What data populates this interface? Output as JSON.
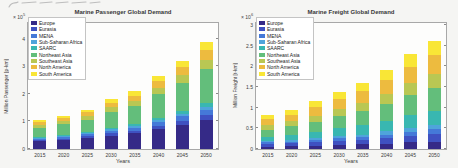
{
  "figure": {
    "background": "#f5f5f3",
    "plot_background": "#fdfdfc",
    "axis_color": "#a8a8a8"
  },
  "chart_data": [
    {
      "type": "stacked-bar",
      "title": "Marine Passenger Global Demand",
      "xlabel": "Years",
      "ylabel": "Million Passenger [p-km]",
      "scale_base": "× 10",
      "scale_exp": "5",
      "ylim": [
        0,
        4.57
      ],
      "yticks": [
        0,
        1,
        2,
        3,
        4
      ],
      "legend_position": "upper-left",
      "grid": false,
      "categories": [
        "2015",
        "2020",
        "2025",
        "2030",
        "2035",
        "2040",
        "2045",
        "2050"
      ],
      "series": [
        {
          "name": "Europe",
          "color": "#352a87",
          "values": [
            0.28,
            0.32,
            0.39,
            0.49,
            0.57,
            0.72,
            0.86,
            1.04
          ]
        },
        {
          "name": "Eurasia",
          "color": "#3f51c1",
          "values": [
            0.05,
            0.06,
            0.07,
            0.09,
            0.1,
            0.13,
            0.16,
            0.19
          ]
        },
        {
          "name": "MENA",
          "color": "#4579d8",
          "values": [
            0.05,
            0.06,
            0.07,
            0.09,
            0.1,
            0.13,
            0.16,
            0.19
          ]
        },
        {
          "name": "Sub-Saharan Africa",
          "color": "#4fa4db",
          "values": [
            0.03,
            0.04,
            0.04,
            0.05,
            0.06,
            0.08,
            0.1,
            0.12
          ]
        },
        {
          "name": "SAARC",
          "color": "#39b7b1",
          "values": [
            0.03,
            0.04,
            0.04,
            0.05,
            0.06,
            0.08,
            0.1,
            0.12
          ]
        },
        {
          "name": "Northeast Asia",
          "color": "#63be7b",
          "values": [
            0.34,
            0.38,
            0.46,
            0.58,
            0.67,
            0.85,
            1.02,
            1.23
          ]
        },
        {
          "name": "Southeast Asia",
          "color": "#b9c753",
          "values": [
            0.09,
            0.11,
            0.13,
            0.16,
            0.19,
            0.24,
            0.29,
            0.35
          ]
        },
        {
          "name": "North America",
          "color": "#edbb3f",
          "values": [
            0.1,
            0.11,
            0.13,
            0.16,
            0.19,
            0.24,
            0.29,
            0.35
          ]
        },
        {
          "name": "South America",
          "color": "#f9e636",
          "values": [
            0.07,
            0.08,
            0.1,
            0.13,
            0.15,
            0.19,
            0.23,
            0.28
          ]
        }
      ]
    },
    {
      "type": "stacked-bar",
      "title": "Marine Freight Global Demand",
      "xlabel": "Years",
      "ylabel": "Million Freight [t-km]",
      "scale_base": "× 10",
      "scale_exp": "6",
      "ylim": [
        0,
        3.05
      ],
      "yticks": [
        0,
        0.5,
        1,
        1.5,
        2,
        2.5,
        3
      ],
      "legend_position": "upper-left",
      "grid": false,
      "categories": [
        "2015",
        "2020",
        "2025",
        "2030",
        "2035",
        "2040",
        "2045",
        "2050"
      ],
      "series": [
        {
          "name": "Europe",
          "color": "#352a87",
          "values": [
            0.06,
            0.07,
            0.08,
            0.1,
            0.11,
            0.13,
            0.16,
            0.18
          ]
        },
        {
          "name": "Eurasia",
          "color": "#3f51c1",
          "values": [
            0.06,
            0.07,
            0.08,
            0.1,
            0.11,
            0.13,
            0.16,
            0.18
          ]
        },
        {
          "name": "MENA",
          "color": "#4579d8",
          "values": [
            0.04,
            0.04,
            0.05,
            0.06,
            0.07,
            0.09,
            0.1,
            0.12
          ]
        },
        {
          "name": "Sub-Saharan Africa",
          "color": "#4fa4db",
          "values": [
            0.03,
            0.04,
            0.05,
            0.06,
            0.06,
            0.08,
            0.09,
            0.1
          ]
        },
        {
          "name": "SAARC",
          "color": "#39b7b1",
          "values": [
            0.11,
            0.13,
            0.16,
            0.19,
            0.22,
            0.26,
            0.31,
            0.35
          ]
        },
        {
          "name": "Northeast Asia",
          "color": "#63be7b",
          "values": [
            0.17,
            0.2,
            0.24,
            0.29,
            0.34,
            0.4,
            0.48,
            0.55
          ]
        },
        {
          "name": "Southeast Asia",
          "color": "#b9c753",
          "values": [
            0.11,
            0.12,
            0.15,
            0.18,
            0.21,
            0.25,
            0.3,
            0.34
          ]
        },
        {
          "name": "North America",
          "color": "#edbb3f",
          "values": [
            0.14,
            0.16,
            0.2,
            0.23,
            0.28,
            0.33,
            0.39,
            0.45
          ]
        },
        {
          "name": "South America",
          "color": "#f9e636",
          "values": [
            0.11,
            0.12,
            0.15,
            0.18,
            0.21,
            0.25,
            0.3,
            0.34
          ]
        }
      ]
    }
  ]
}
